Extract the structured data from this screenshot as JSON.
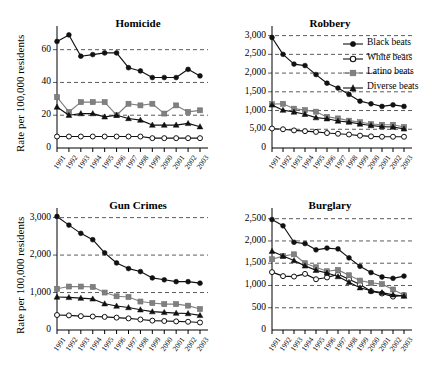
{
  "figure": {
    "y_axis_label": "Rate per 100,000 residents",
    "years": [
      "1991",
      "1992",
      "1993",
      "1994",
      "1995",
      "1996",
      "1997",
      "1998",
      "1999",
      "2000",
      "2001",
      "2002",
      "2003"
    ],
    "legend": {
      "position": "top-right of Robbery panel",
      "entries": [
        {
          "label": "Black beats",
          "marker": "filled-circle",
          "color": "#111111"
        },
        {
          "label": "White beats",
          "marker": "open-circle",
          "color": "#111111"
        },
        {
          "label": "Latino beats",
          "marker": "filled-square",
          "color": "#808080"
        },
        {
          "label": "Diverse beats",
          "marker": "filled-triangle",
          "color": "#111111"
        }
      ]
    }
  },
  "chart_data": [
    {
      "type": "line",
      "title": "Homicide",
      "xlabel": "",
      "ylabel": "Rate per 100,000 residents",
      "x": [
        "1991",
        "1992",
        "1993",
        "1994",
        "1995",
        "1996",
        "1997",
        "1998",
        "1999",
        "2000",
        "2001",
        "2002",
        "2003"
      ],
      "yticks": [
        "0",
        "20",
        "40",
        "60"
      ],
      "ytick_values": [
        0,
        20,
        40,
        60
      ],
      "ylim": [
        0,
        72
      ],
      "grid": true,
      "series": [
        {
          "name": "Black beats",
          "marker": "filled-circle",
          "values": [
            65,
            69,
            56,
            57,
            58,
            58,
            49,
            47,
            43,
            43,
            43,
            48,
            44
          ]
        },
        {
          "name": "White beats",
          "marker": "open-circle",
          "values": [
            7,
            7,
            7,
            7,
            7,
            7,
            7,
            7,
            6,
            6,
            6,
            6,
            6
          ]
        },
        {
          "name": "Latino beats",
          "marker": "filled-square",
          "values": [
            31,
            22,
            28,
            28,
            28,
            20,
            27,
            26,
            27,
            21,
            26,
            22,
            23
          ]
        },
        {
          "name": "Diverse beats",
          "marker": "filled-triangle",
          "values": [
            25,
            20,
            21,
            21,
            19,
            20,
            18,
            17,
            14,
            14,
            14,
            15,
            13
          ]
        }
      ]
    },
    {
      "type": "line",
      "title": "Robbery",
      "xlabel": "",
      "ylabel": "Rate per 100,000 residents",
      "x": [
        "1991",
        "1992",
        "1993",
        "1994",
        "1995",
        "1996",
        "1997",
        "1998",
        "1999",
        "2000",
        "2001",
        "2002",
        "2003"
      ],
      "yticks": [
        "0",
        "5,00",
        "1,000",
        "1,500",
        "2,000",
        "2,500",
        "3,000"
      ],
      "ytick_values": [
        0,
        500,
        1000,
        1500,
        2000,
        2500,
        3000
      ],
      "ylim": [
        0,
        3150
      ],
      "grid": true,
      "series": [
        {
          "name": "Black beats",
          "marker": "filled-circle",
          "values": [
            2950,
            2500,
            2240,
            2200,
            1960,
            1730,
            1600,
            1430,
            1250,
            1180,
            1110,
            1150,
            1110
          ]
        },
        {
          "name": "White beats",
          "marker": "open-circle",
          "values": [
            520,
            500,
            470,
            450,
            430,
            400,
            380,
            360,
            330,
            310,
            300,
            300,
            300
          ]
        },
        {
          "name": "Latino beats",
          "marker": "filled-square",
          "values": [
            1170,
            1180,
            1050,
            1010,
            970,
            830,
            790,
            730,
            690,
            640,
            620,
            620,
            560
          ]
        },
        {
          "name": "Diverse beats",
          "marker": "filled-triangle",
          "values": [
            1150,
            1010,
            960,
            900,
            810,
            780,
            720,
            690,
            640,
            600,
            570,
            560,
            510
          ]
        }
      ]
    },
    {
      "type": "line",
      "title": "Gun Crimes",
      "xlabel": "",
      "ylabel": "Rate per 100,000 residents",
      "x": [
        "1991",
        "1992",
        "1993",
        "1994",
        "1995",
        "1996",
        "1997",
        "1998",
        "1999",
        "2000",
        "2001",
        "2002",
        "2003"
      ],
      "yticks": [
        "0",
        "1,000",
        "2,000",
        "3,000"
      ],
      "ytick_values": [
        0,
        1000,
        2000,
        3000
      ],
      "ylim": [
        0,
        3150
      ],
      "grid": true,
      "series": [
        {
          "name": "Black beats",
          "marker": "filled-circle",
          "values": [
            3030,
            2800,
            2580,
            2410,
            2060,
            1790,
            1640,
            1560,
            1390,
            1340,
            1290,
            1290,
            1250
          ]
        },
        {
          "name": "White beats",
          "marker": "open-circle",
          "values": [
            400,
            390,
            370,
            360,
            350,
            330,
            310,
            280,
            250,
            240,
            230,
            220,
            200
          ]
        },
        {
          "name": "Latino beats",
          "marker": "filled-square",
          "values": [
            1100,
            1160,
            1160,
            1150,
            1000,
            900,
            880,
            760,
            720,
            690,
            690,
            650,
            560
          ]
        },
        {
          "name": "Diverse beats",
          "marker": "filled-triangle",
          "values": [
            880,
            870,
            850,
            830,
            700,
            640,
            600,
            540,
            490,
            470,
            450,
            440,
            390
          ]
        }
      ]
    },
    {
      "type": "line",
      "title": "Burglary",
      "xlabel": "",
      "ylabel": "Rate per 100,000 residents",
      "x": [
        "1991",
        "1992",
        "1993",
        "1994",
        "1995",
        "1996",
        "1997",
        "1998",
        "1999",
        "2000",
        "2001",
        "2002",
        "2003"
      ],
      "yticks": [
        "0",
        "500",
        "1,000",
        "1,500",
        "2,000",
        "2,500"
      ],
      "ytick_values": [
        0,
        500,
        1000,
        1500,
        2000,
        2500
      ],
      "ylim": [
        0,
        2650
      ],
      "grid": true,
      "series": [
        {
          "name": "Black beats",
          "marker": "filled-circle",
          "values": [
            2480,
            2340,
            1970,
            1940,
            1800,
            1840,
            1820,
            1620,
            1430,
            1290,
            1190,
            1160,
            1210
          ]
        },
        {
          "name": "White beats",
          "marker": "open-circle",
          "values": [
            1300,
            1210,
            1200,
            1260,
            1140,
            1180,
            1250,
            1140,
            1020,
            870,
            820,
            750,
            780
          ]
        },
        {
          "name": "Latino beats",
          "marker": "filled-square",
          "values": [
            1590,
            1660,
            1700,
            1500,
            1410,
            1320,
            1350,
            1230,
            1110,
            1060,
            1030,
            910,
            780
          ]
        },
        {
          "name": "Diverse beats",
          "marker": "filled-triangle",
          "values": [
            1770,
            1660,
            1560,
            1440,
            1340,
            1280,
            1200,
            1070,
            950,
            880,
            840,
            790,
            760
          ]
        }
      ]
    }
  ]
}
